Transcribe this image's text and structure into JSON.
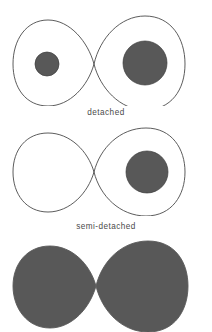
{
  "page": {
    "background_color": "#ffffff"
  },
  "style": {
    "lobe_stroke_color": "#4a4a4a",
    "lobe_stroke_width": "0.9",
    "star_fill_color": "#585858",
    "star_stroke_color": "#3c3c3c",
    "caption_color": "#4a4a4a"
  },
  "figures": [
    {
      "id": "detached",
      "caption": "detached",
      "description": "Roche lobe outline with two small separated stars, neither filling its lobe",
      "lobe_outline": {
        "cross_x": 94,
        "cross_y": 56,
        "left_extent_x": 13,
        "right_extent_x": 185,
        "top_y": 12,
        "bottom_y": 98
      },
      "stars": [
        {
          "name": "primary-star",
          "cx": 47,
          "cy": 56,
          "r": 12,
          "fill": "#585858"
        },
        {
          "name": "secondary-star",
          "cx": 145,
          "cy": 55,
          "r": 22,
          "fill": "#585858"
        }
      ]
    },
    {
      "id": "semi-detached",
      "caption": "semi-detached",
      "description": "Roche lobe outline with one star filling its lobe and one empty lobe",
      "lobe_outline": {
        "cross_x": 94,
        "cross_y": 48,
        "left_extent_x": 13,
        "right_extent_x": 185,
        "top_y": 9,
        "bottom_y": 90
      },
      "stars": [
        {
          "name": "filled-lobe-star",
          "cx": 147,
          "cy": 48,
          "r": 21,
          "fill": "#585858"
        }
      ]
    },
    {
      "id": "contact",
      "caption": "",
      "description": "Contact binary: both lobes completely filled, shown as a solid shaded figure-eight",
      "lobe_outline": {
        "cross_x": 94,
        "cross_y": 46,
        "left_extent_x": 13,
        "right_extent_x": 188,
        "top_y": 6,
        "bottom_y": 92
      },
      "stars": []
    }
  ]
}
